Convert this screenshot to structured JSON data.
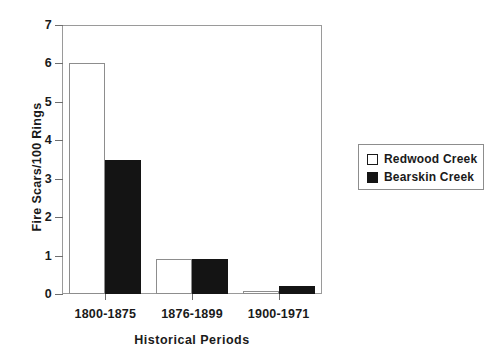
{
  "chart_data": {
    "type": "bar",
    "title": "",
    "xlabel": "Historical Periods",
    "ylabel": "Fire Scars/100 Rings",
    "categories": [
      "1800-1875",
      "1876-1899",
      "1900-1971"
    ],
    "series": [
      {
        "name": "Redwood Creek",
        "style": "open",
        "color": "#ffffff",
        "values": [
          6.0,
          0.9,
          0.07
        ]
      },
      {
        "name": "Bearskin Creek",
        "style": "filled",
        "color": "#141414",
        "values": [
          3.5,
          0.9,
          0.2
        ]
      }
    ],
    "ylim": [
      0,
      7
    ],
    "yticks": [
      0,
      1,
      2,
      3,
      4,
      5,
      6,
      7
    ],
    "ytick_labels": [
      "0",
      "1",
      "2",
      "3",
      "4",
      "5",
      "6",
      "7"
    ],
    "grid": false,
    "legend_position": "right"
  },
  "legend": {
    "entries": [
      {
        "label": "Redwood Creek",
        "style": "open"
      },
      {
        "label": "Bearskin Creek",
        "style": "filled"
      }
    ]
  }
}
